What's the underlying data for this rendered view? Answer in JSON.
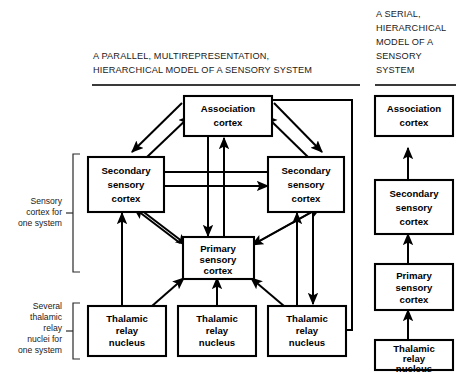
{
  "figure": {
    "kind": "neuroanatomy-schematic",
    "background_color": "#ffffff",
    "line_color": "#000000"
  },
  "left_panel": {
    "title_lines": [
      "A PARALLEL, MULTIREPRESENTATION,",
      "HIERARCHICAL MODEL OF A SENSORY SYSTEM"
    ],
    "boxes": {
      "association": "Association\ncortex",
      "association_l1": "Association",
      "association_l2": "cortex",
      "secondary_left_l1": "Secondary",
      "secondary_left_l2": "sensory",
      "secondary_left_l3": "cortex",
      "secondary_right_l1": "Secondary",
      "secondary_right_l2": "sensory",
      "secondary_right_l3": "cortex",
      "primary_l1": "Primary",
      "primary_l2": "sensory",
      "primary_l3": "cortex",
      "thalamic_left_l1": "Thalamic",
      "thalamic_left_l2": "relay",
      "thalamic_left_l3": "nucleus",
      "thalamic_mid_l1": "Thalamic",
      "thalamic_mid_l2": "relay",
      "thalamic_mid_l3": "nucleus",
      "thalamic_right_l1": "Thalamic",
      "thalamic_right_l2": "relay",
      "thalamic_right_l3": "nucleus"
    },
    "bracket_labels": {
      "cortex_bracket": [
        "Sensory",
        "cortex for",
        "one system"
      ],
      "thalamic_bracket": [
        "Several",
        "thalamic",
        "relay",
        "nuclei for",
        "one system"
      ]
    }
  },
  "right_panel": {
    "title_lines": [
      "A SERIAL,",
      "HIERARCHICAL",
      "MODEL OF A",
      "SENSORY",
      "SYSTEM"
    ],
    "boxes": {
      "association_l1": "Association",
      "association_l2": "cortex",
      "secondary_l1": "Secondary",
      "secondary_l2": "sensory",
      "secondary_l3": "cortex",
      "primary_l1": "Primary",
      "primary_l2": "sensory",
      "primary_l3": "cortex",
      "thalamic_l1": "Thalamic",
      "thalamic_l2": "relay",
      "thalamic_l3": "nucleus"
    }
  }
}
